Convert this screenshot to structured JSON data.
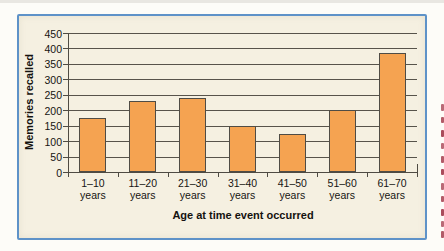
{
  "figure": {
    "frame_border_color": "#5e92c8",
    "frame_background_color": "#f5f0e1",
    "cutoff_caption_fragment_color": "#a23a4b"
  },
  "chart_data": {
    "type": "bar",
    "title": "",
    "categories": [
      "1–10 years",
      "11–20 years",
      "21–30 years",
      "31–40 years",
      "41–50 years",
      "51–60 years",
      "61–70 years"
    ],
    "values": [
      175,
      230,
      240,
      150,
      122,
      202,
      385
    ],
    "xlabel": "Age at time event occurred",
    "ylabel": "Memories recalled",
    "ylim": [
      0,
      450
    ],
    "ytick_step": 50,
    "grid": true,
    "legend": false,
    "bar_fill_color": "#f5a351",
    "bar_border_color": "#4f4c45",
    "gridline_color": "#57534b",
    "axis_text_color": "#161411"
  }
}
